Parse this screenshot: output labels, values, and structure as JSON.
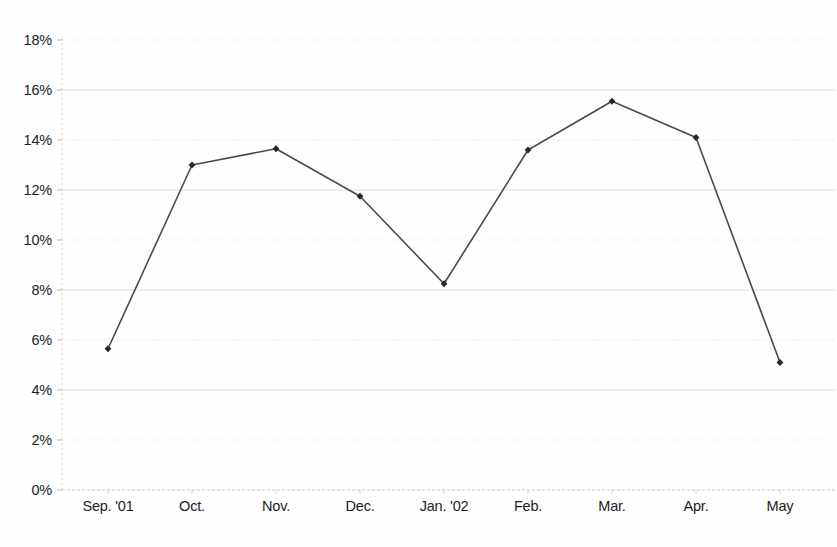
{
  "chart_data": {
    "type": "line",
    "title": "",
    "xlabel": "",
    "ylabel": "",
    "categories": [
      "Sep. '01",
      "Oct.",
      "Nov.",
      "Dec.",
      "Jan. '02",
      "Feb.",
      "Mar.",
      "Apr.",
      "May"
    ],
    "values": [
      5.65,
      13.0,
      13.65,
      11.75,
      8.25,
      13.6,
      15.55,
      14.1,
      5.1
    ],
    "value_suffix": "%",
    "ylim": [
      0,
      18
    ],
    "ytick_step": 2,
    "ytick_labels": [
      "0%",
      "2%",
      "4%",
      "6%",
      "8%",
      "10%",
      "12%",
      "14%",
      "16%",
      "18%"
    ],
    "ytick_values": [
      0,
      2,
      4,
      6,
      8,
      10,
      12,
      14,
      16,
      18
    ],
    "grid": true,
    "grid_axis": "y",
    "legend": "none",
    "series": [
      {
        "name": "",
        "values": [
          5.65,
          13.0,
          13.65,
          11.75,
          8.25,
          13.6,
          15.55,
          14.1,
          5.1
        ]
      }
    ]
  },
  "style": {
    "line_color": "#4a4a4a",
    "marker_color": "#262626",
    "grid_color": "#d8d8d8",
    "axis_color": "#b9b9b9",
    "text_color": "#1d1d1d",
    "background": "#fefefe"
  },
  "geometry": {
    "plot_left": 62,
    "plot_right": 835,
    "plot_top": 40,
    "plot_bottom": 490,
    "first_point_x": 108,
    "x_spacing": 84
  }
}
